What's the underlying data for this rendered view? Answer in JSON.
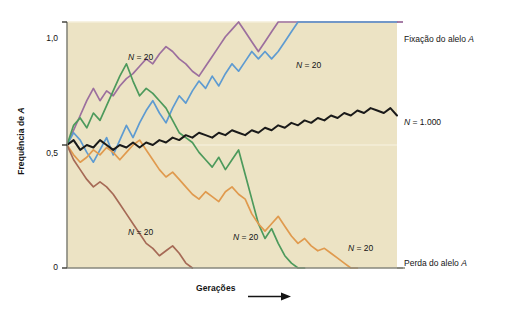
{
  "figure": {
    "background": "#ffffff",
    "plot_background": "#ece3c4",
    "frame_color": "#8a8a80"
  },
  "axes": {
    "y_title": "Frequência de A",
    "y_ticks": [
      "1,0",
      "0,5",
      "0"
    ],
    "y_tick_values": [
      1.0,
      0.5,
      0
    ],
    "x_title": "Gerações",
    "x_arrow_icon": "right-arrow-icon"
  },
  "side_labels": [
    {
      "text": "Fixação do alelo A",
      "italic_tail": "A",
      "y": 1.0
    },
    {
      "text": "N = 1.000",
      "y": 0.62
    },
    {
      "text": "Perda do alelo A",
      "italic_tail": "A",
      "y": 0.0
    }
  ],
  "annotations": [
    {
      "label": "N = 20",
      "x": 128,
      "y": 52
    },
    {
      "label": "N = 20",
      "x": 296,
      "y": 60
    },
    {
      "label": "N = 20",
      "x": 128,
      "y": 227
    },
    {
      "label": "N = 20",
      "x": 233,
      "y": 232
    },
    {
      "label": "N = 20",
      "x": 348,
      "y": 243
    }
  ],
  "chart_data": {
    "type": "line",
    "title": "",
    "xlabel": "Gerações",
    "ylabel": "Frequência de A",
    "xlim": [
      0,
      50
    ],
    "ylim": [
      0,
      1.0
    ],
    "grid": false,
    "legend": "right-side annotations",
    "note": "Simulação de deriva genética: cinco populações com N = 20 e uma com N = 1.000, todas iniciando em frequência 0,5.",
    "series": [
      {
        "name": "N = 20 (fixação, roxo)",
        "color": "#9c6f9e",
        "outcome": "Fixação do alelo A",
        "x": [
          0,
          1,
          2,
          3,
          4,
          5,
          6,
          7,
          8,
          9,
          10,
          11,
          12,
          13,
          14,
          15,
          16,
          17,
          18,
          19,
          20,
          21,
          22,
          23,
          24,
          25,
          26,
          27,
          28,
          29,
          30,
          31,
          32,
          33,
          34,
          35,
          36,
          37,
          38,
          39,
          40,
          41,
          42,
          43,
          44,
          45,
          46,
          47,
          48,
          49,
          50
        ],
        "y": [
          0.5,
          0.56,
          0.62,
          0.68,
          0.73,
          0.68,
          0.72,
          0.7,
          0.74,
          0.77,
          0.79,
          0.82,
          0.85,
          0.83,
          0.87,
          0.9,
          0.88,
          0.85,
          0.83,
          0.8,
          0.78,
          0.82,
          0.86,
          0.9,
          0.94,
          0.97,
          1.0,
          0.96,
          0.92,
          0.88,
          0.92,
          0.96,
          1.0,
          1.0,
          1.0,
          1.0,
          1.0,
          1.0,
          1.0,
          1.0,
          1.0,
          1.0,
          1.0,
          1.0,
          1.0,
          1.0,
          1.0,
          1.0,
          1.0,
          1.0,
          1.0
        ]
      },
      {
        "name": "N = 20 (fixação, azul)",
        "color": "#5e9bd1",
        "outcome": "Fixação do alelo A",
        "x": [
          0,
          1,
          2,
          3,
          4,
          5,
          6,
          7,
          8,
          9,
          10,
          11,
          12,
          13,
          14,
          15,
          16,
          17,
          18,
          19,
          20,
          21,
          22,
          23,
          24,
          25,
          26,
          27,
          28,
          29,
          30,
          31,
          32,
          33,
          34,
          35,
          36,
          37,
          38,
          39,
          40,
          41,
          42,
          43,
          44,
          45,
          46,
          47,
          48,
          49,
          50
        ],
        "y": [
          0.5,
          0.55,
          0.52,
          0.47,
          0.43,
          0.48,
          0.53,
          0.46,
          0.52,
          0.58,
          0.53,
          0.59,
          0.64,
          0.68,
          0.63,
          0.59,
          0.65,
          0.7,
          0.67,
          0.72,
          0.76,
          0.73,
          0.78,
          0.74,
          0.79,
          0.83,
          0.8,
          0.84,
          0.88,
          0.85,
          0.88,
          0.85,
          0.88,
          0.92,
          0.96,
          1.0,
          1.0,
          1.0,
          1.0,
          1.0,
          1.0,
          1.0,
          1.0,
          1.0,
          1.0,
          1.0,
          1.0,
          1.0,
          1.0,
          1.0,
          1.0
        ]
      },
      {
        "name": "N = 20 (perda, verde)",
        "color": "#4d9a5c",
        "outcome": "Perda do alelo A",
        "x": [
          0,
          1,
          2,
          3,
          4,
          5,
          6,
          7,
          8,
          9,
          10,
          11,
          12,
          13,
          14,
          15,
          16,
          17,
          18,
          19,
          20,
          21,
          22,
          23,
          24,
          25,
          26,
          27,
          28,
          29,
          30,
          31,
          32,
          33,
          34,
          35,
          36
        ],
        "y": [
          0.5,
          0.58,
          0.61,
          0.57,
          0.63,
          0.6,
          0.66,
          0.72,
          0.78,
          0.83,
          0.76,
          0.7,
          0.73,
          0.71,
          0.68,
          0.65,
          0.6,
          0.55,
          0.53,
          0.51,
          0.47,
          0.44,
          0.41,
          0.45,
          0.4,
          0.44,
          0.48,
          0.38,
          0.28,
          0.18,
          0.12,
          0.16,
          0.1,
          0.05,
          0.02,
          0.0,
          0.0
        ]
      },
      {
        "name": "N = 20 (perda, laranja)",
        "color": "#e09a4e",
        "outcome": "Perda do alelo A",
        "x": [
          0,
          1,
          2,
          3,
          4,
          5,
          6,
          7,
          8,
          9,
          10,
          11,
          12,
          13,
          14,
          15,
          16,
          17,
          18,
          19,
          20,
          21,
          22,
          23,
          24,
          25,
          26,
          27,
          28,
          29,
          30,
          31,
          32,
          33,
          34,
          35,
          36,
          37,
          38,
          39,
          40,
          41,
          42,
          43,
          44
        ],
        "y": [
          0.5,
          0.46,
          0.43,
          0.45,
          0.48,
          0.46,
          0.49,
          0.47,
          0.44,
          0.47,
          0.5,
          0.52,
          0.48,
          0.44,
          0.4,
          0.37,
          0.39,
          0.36,
          0.33,
          0.3,
          0.28,
          0.31,
          0.29,
          0.27,
          0.31,
          0.33,
          0.3,
          0.28,
          0.22,
          0.18,
          0.15,
          0.18,
          0.21,
          0.17,
          0.13,
          0.1,
          0.12,
          0.09,
          0.07,
          0.08,
          0.06,
          0.04,
          0.02,
          0.0,
          0.0
        ]
      },
      {
        "name": "N = 20 (perda, marrom)",
        "color": "#a66a56",
        "outcome": "Perda do alelo A",
        "x": [
          0,
          1,
          2,
          3,
          4,
          5,
          6,
          7,
          8,
          9,
          10,
          11,
          12,
          13,
          14,
          15,
          16,
          17,
          18,
          19
        ],
        "y": [
          0.5,
          0.44,
          0.4,
          0.36,
          0.33,
          0.35,
          0.33,
          0.3,
          0.26,
          0.22,
          0.18,
          0.14,
          0.1,
          0.08,
          0.05,
          0.07,
          0.09,
          0.06,
          0.02,
          0.0
        ]
      },
      {
        "name": "N = 1.000",
        "color": "#1a1a1a",
        "outcome": "Frequência próxima de 0,5 com pequena deriva",
        "x": [
          0,
          1,
          2,
          3,
          4,
          5,
          6,
          7,
          8,
          9,
          10,
          11,
          12,
          13,
          14,
          15,
          16,
          17,
          18,
          19,
          20,
          21,
          22,
          23,
          24,
          25,
          26,
          27,
          28,
          29,
          30,
          31,
          32,
          33,
          34,
          35,
          36,
          37,
          38,
          39,
          40,
          41,
          42,
          43,
          44,
          45,
          46,
          47,
          48,
          49,
          50
        ],
        "y": [
          0.5,
          0.52,
          0.48,
          0.5,
          0.49,
          0.52,
          0.5,
          0.48,
          0.5,
          0.49,
          0.51,
          0.49,
          0.51,
          0.5,
          0.52,
          0.51,
          0.53,
          0.52,
          0.54,
          0.53,
          0.55,
          0.54,
          0.53,
          0.55,
          0.54,
          0.56,
          0.55,
          0.54,
          0.56,
          0.55,
          0.57,
          0.56,
          0.58,
          0.57,
          0.59,
          0.58,
          0.6,
          0.59,
          0.61,
          0.6,
          0.62,
          0.61,
          0.63,
          0.62,
          0.64,
          0.63,
          0.65,
          0.64,
          0.63,
          0.65,
          0.62
        ]
      }
    ]
  }
}
